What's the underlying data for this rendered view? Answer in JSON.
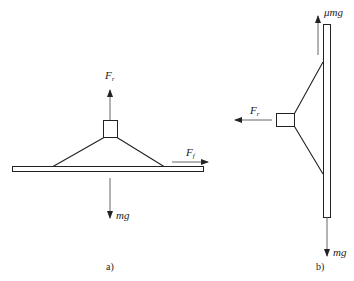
{
  "figure_a": {
    "caption": "a)",
    "forces": {
      "up": {
        "symbol": "F",
        "subscript": "r"
      },
      "right": {
        "symbol": "F",
        "subscript": "f"
      },
      "down": {
        "label": "mg"
      }
    }
  },
  "figure_b": {
    "caption": "b)",
    "forces": {
      "left": {
        "symbol": "F",
        "subscript": "r"
      },
      "up": {
        "label": "μmg"
      },
      "down": {
        "label": "mg"
      }
    }
  },
  "colors": {
    "stroke": "#222222",
    "background": "#ffffff"
  }
}
